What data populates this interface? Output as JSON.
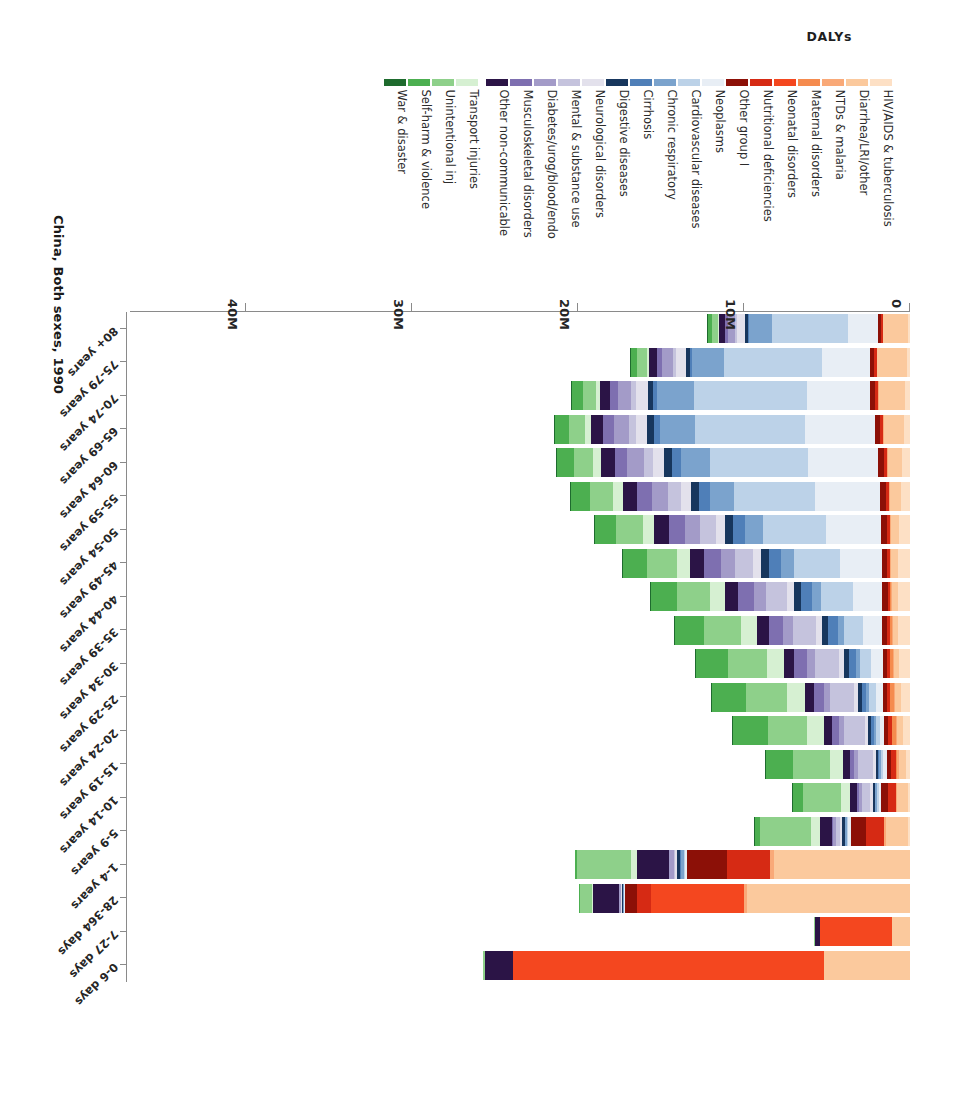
{
  "chart_data": {
    "type": "bar",
    "title": "China, Both sexes, 1990",
    "xlabel": "DALYs",
    "ylabel": "",
    "orientation": "horizontal-stacked",
    "grid": false,
    "legend_position": "top",
    "xlim": [
      0,
      47000000
    ],
    "xticks": [
      0,
      10000000,
      20000000,
      30000000,
      40000000
    ],
    "xticklabels": [
      "0",
      "10M",
      "20M",
      "30M",
      "40M"
    ],
    "categories": [
      "0-6 days",
      "7-27 days",
      "28-364 days",
      "1-4 years",
      "5-9 years",
      "10-14 years",
      "15-19 years",
      "20-24 years",
      "25-29 years",
      "30-34 years",
      "35-39 years",
      "40-44 years",
      "45-49 years",
      "50-54 years",
      "55-59 years",
      "60-64 years",
      "65-69 years",
      "70-74 years",
      "75-79 years",
      "80+ years"
    ],
    "series": [
      {
        "name": "HIV/AIDS & tuberculosis",
        "color": "#fde0c5",
        "values": [
          0,
          0,
          0,
          0,
          120000,
          150000,
          260000,
          420000,
          560000,
          640000,
          700000,
          720000,
          700000,
          640000,
          560000,
          470000,
          380000,
          290000,
          190000,
          110000
        ]
      },
      {
        "name": "Diarrhea/LRI/other",
        "color": "#fbc99d",
        "values": [
          5200000,
          1100000,
          9800000,
          8200000,
          1300000,
          620000,
          430000,
          380000,
          330000,
          320000,
          330000,
          360000,
          420000,
          520000,
          660000,
          880000,
          1200000,
          1600000,
          1800000,
          1500000
        ]
      },
      {
        "name": "NTDs & malaria",
        "color": "#f9a978",
        "values": [
          0,
          0,
          180000,
          240000,
          130000,
          90000,
          70000,
          70000,
          70000,
          70000,
          70000,
          70000,
          70000,
          60000,
          60000,
          50000,
          40000,
          30000,
          20000,
          10000
        ]
      },
      {
        "name": "Maternal disorders",
        "color": "#f58b4e",
        "values": [
          0,
          0,
          0,
          0,
          0,
          10000,
          90000,
          230000,
          250000,
          180000,
          110000,
          40000,
          10000,
          0,
          0,
          0,
          0,
          0,
          0,
          0
        ]
      },
      {
        "name": "Neonatal disorders",
        "color": "#f4471f",
        "values": [
          18700000,
          4300000,
          5600000,
          0,
          0,
          0,
          0,
          0,
          0,
          0,
          0,
          0,
          0,
          0,
          0,
          0,
          0,
          0,
          0,
          0
        ]
      },
      {
        "name": "Nutritional deficiencies",
        "color": "#d62a14",
        "values": [
          0,
          0,
          900000,
          2600000,
          1100000,
          480000,
          300000,
          230000,
          200000,
          180000,
          170000,
          160000,
          160000,
          160000,
          160000,
          160000,
          170000,
          180000,
          160000,
          120000
        ]
      },
      {
        "name": "Other group I",
        "color": "#8c1007",
        "values": [
          0,
          0,
          700000,
          2400000,
          900000,
          380000,
          260000,
          230000,
          230000,
          250000,
          280000,
          310000,
          340000,
          360000,
          370000,
          370000,
          350000,
          320000,
          250000,
          170000
        ]
      },
      {
        "name": "Neoplasms",
        "color": "#e8eef5",
        "values": [
          0,
          0,
          30000,
          140000,
          170000,
          170000,
          200000,
          270000,
          420000,
          690000,
          1150000,
          1800000,
          2500000,
          3300000,
          3900000,
          4200000,
          4200000,
          3800000,
          2900000,
          1800000
        ]
      },
      {
        "name": "Cardiovascular diseases",
        "color": "#bcd2e8",
        "values": [
          0,
          0,
          20000,
          60000,
          70000,
          90000,
          140000,
          230000,
          400000,
          700000,
          1200000,
          1900000,
          2800000,
          3800000,
          4900000,
          5900000,
          6600000,
          6800000,
          5900000,
          4600000
        ]
      },
      {
        "name": "Chronic respiratory",
        "color": "#7ba3cd",
        "values": [
          0,
          0,
          60000,
          160000,
          120000,
          100000,
          110000,
          130000,
          180000,
          250000,
          360000,
          520000,
          760000,
          1080000,
          1450000,
          1800000,
          2100000,
          2200000,
          1900000,
          1400000
        ]
      },
      {
        "name": "Cirrhosis",
        "color": "#4f7fb8",
        "values": [
          0,
          0,
          10000,
          40000,
          40000,
          50000,
          80000,
          140000,
          250000,
          400000,
          560000,
          680000,
          740000,
          730000,
          650000,
          520000,
          380000,
          250000,
          140000,
          70000
        ]
      },
      {
        "name": "Digestive diseases",
        "color": "#17365d",
        "values": [
          0,
          0,
          70000,
          190000,
          130000,
          110000,
          140000,
          180000,
          230000,
          290000,
          360000,
          420000,
          470000,
          500000,
          500000,
          470000,
          420000,
          350000,
          250000,
          160000
        ]
      },
      {
        "name": "Neurological disorders",
        "color": "#e3e1ec",
        "values": [
          0,
          0,
          40000,
          120000,
          130000,
          140000,
          170000,
          210000,
          260000,
          320000,
          380000,
          440000,
          500000,
          560000,
          610000,
          650000,
          680000,
          680000,
          620000,
          520000
        ]
      },
      {
        "name": "Mental & substance use",
        "color": "#c5c3dd",
        "values": [
          0,
          0,
          0,
          90000,
          260000,
          520000,
          900000,
          1250000,
          1420000,
          1450000,
          1380000,
          1250000,
          1090000,
          920000,
          740000,
          570000,
          420000,
          290000,
          180000,
          100000
        ]
      },
      {
        "name": "Diabetes/urog/blood/endo",
        "color": "#a39bc8",
        "values": [
          0,
          0,
          120000,
          280000,
          200000,
          180000,
          220000,
          290000,
          380000,
          480000,
          600000,
          730000,
          860000,
          960000,
          1010000,
          1000000,
          930000,
          800000,
          610000,
          420000
        ]
      },
      {
        "name": "Musculoskeletal disorders",
        "color": "#7e6fb0",
        "values": [
          0,
          0,
          0,
          20000,
          60000,
          130000,
          280000,
          450000,
          620000,
          760000,
          880000,
          960000,
          990000,
          960000,
          880000,
          760000,
          620000,
          470000,
          320000,
          190000
        ]
      },
      {
        "name": "Other non-communicable",
        "color": "#2b1446",
        "values": [
          1700000,
          350000,
          1600000,
          1900000,
          700000,
          420000,
          420000,
          480000,
          560000,
          640000,
          720000,
          790000,
          840000,
          870000,
          860000,
          810000,
          730000,
          620000,
          470000,
          330000
        ]
      },
      {
        "name": "Transport injuries",
        "color": "#d6f0d2",
        "values": [
          0,
          0,
          60000,
          350000,
          520000,
          520000,
          760000,
          1000000,
          1050000,
          1020000,
          960000,
          880000,
          790000,
          690000,
          580000,
          470000,
          360000,
          260000,
          160000,
          90000
        ]
      },
      {
        "name": "Unintentional inj",
        "color": "#8ed08a",
        "values": [
          140000,
          40000,
          700000,
          3300000,
          3100000,
          2300000,
          2200000,
          2400000,
          2450000,
          2350000,
          2200000,
          2000000,
          1800000,
          1600000,
          1400000,
          1200000,
          1000000,
          800000,
          570000,
          370000
        ]
      },
      {
        "name": "Self-harm & violence",
        "color": "#4caf50",
        "values": [
          0,
          0,
          20000,
          120000,
          320000,
          620000,
          1650000,
          2100000,
          2050000,
          1900000,
          1750000,
          1600000,
          1450000,
          1300000,
          1150000,
          980000,
          800000,
          610000,
          410000,
          240000
        ]
      },
      {
        "name": "War & disaster",
        "color": "#1e6b2e",
        "values": [
          0,
          0,
          0,
          0,
          10000,
          10000,
          20000,
          30000,
          30000,
          30000,
          30000,
          30000,
          30000,
          20000,
          20000,
          20000,
          20000,
          10000,
          10000,
          10000
        ]
      }
    ]
  },
  "legend": {
    "items": [
      {
        "label": "HIV/AIDS & tuberculosis",
        "color": "#fde0c5"
      },
      {
        "label": "Diarrhea/LRI/other",
        "color": "#fbc99d"
      },
      {
        "label": "NTDs & malaria",
        "color": "#f9a978"
      },
      {
        "label": "Maternal disorders",
        "color": "#f58b4e"
      },
      {
        "label": "Neonatal disorders",
        "color": "#f4471f"
      },
      {
        "label": "Nutritional deficiencies",
        "color": "#d62a14"
      },
      {
        "label": "Other group I",
        "color": "#8c1007"
      },
      {
        "label": "Neoplasms",
        "color": "#e8eef5"
      },
      {
        "label": "Cardiovascular diseases",
        "color": "#bcd2e8"
      },
      {
        "label": "Chronic respiratory",
        "color": "#7ba3cd"
      },
      {
        "label": "Cirrhosis",
        "color": "#4f7fb8"
      },
      {
        "label": "Digestive diseases",
        "color": "#17365d"
      },
      {
        "label": "Neurological disorders",
        "color": "#e3e1ec"
      },
      {
        "label": "Mental & substance use",
        "color": "#c5c3dd"
      },
      {
        "label": "Diabetes/urog/blood/endo",
        "color": "#a39bc8"
      },
      {
        "label": "Musculoskeletal disorders",
        "color": "#7e6fb0"
      },
      {
        "label": "Other non-communicable",
        "color": "#2b1446"
      },
      {
        "label": "Transport injuries",
        "color": "#d6f0d2"
      },
      {
        "label": "Unintentional inj",
        "color": "#8ed08a"
      },
      {
        "label": "Self-harm & violence",
        "color": "#4caf50"
      },
      {
        "label": "War & disaster",
        "color": "#1e6b2e"
      }
    ]
  },
  "axes": {
    "x_title": "DALYs",
    "x_ticklabels": [
      "0",
      "10M",
      "20M",
      "30M",
      "40M"
    ],
    "y_ticklabels": [
      "0-6 days",
      "7-27 days",
      "28-364 days",
      "1-4 years",
      "5-9 years",
      "10-14 years",
      "15-19 years",
      "20-24 years",
      "25-29 years",
      "30-34 years",
      "35-39 years",
      "40-44 years",
      "45-49 years",
      "50-54 years",
      "55-59 years",
      "60-64 years",
      "65-69 years",
      "70-74 years",
      "75-79 years",
      "80+ years"
    ]
  }
}
